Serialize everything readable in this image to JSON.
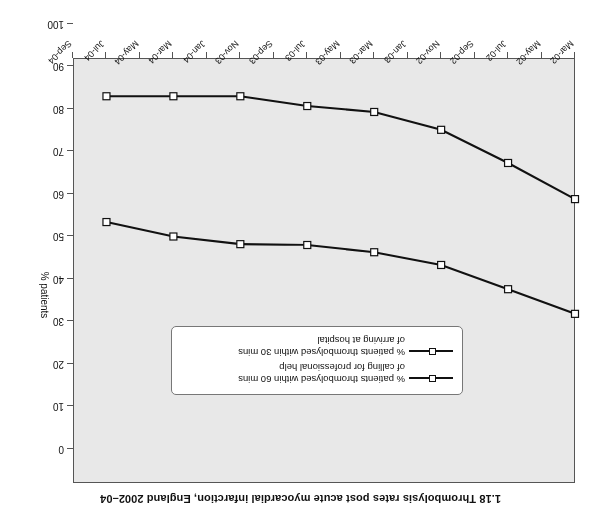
{
  "figure": {
    "title": "1.18 Thrombolysis rates post acute myocardial infarction, England 2002–04",
    "orientation_note": "rotated-180"
  },
  "chart_data": {
    "type": "line",
    "title": "1.18 Thrombolysis rates post acute myocardial infarction, England 2002–04",
    "xlabel": "",
    "ylabel": "% patients",
    "ylim": [
      0,
      100
    ],
    "ytick_labels": [
      "0",
      "10",
      "20",
      "30",
      "40",
      "50",
      "60",
      "70",
      "80",
      "90",
      "100"
    ],
    "yticks": [
      0,
      10,
      20,
      30,
      40,
      50,
      60,
      70,
      80,
      90,
      100
    ],
    "grid": false,
    "legend_position": "upper-centre",
    "categories": [
      "Mar-02",
      "May-02",
      "Jul-02",
      "Sep-02",
      "Nov-02",
      "Jan-03",
      "Mar-03",
      "May-03",
      "Jul-03",
      "Sep-03",
      "Nov-03",
      "Jan-04",
      "Mar-04",
      "May-04",
      "Jul-04",
      "Sep-04"
    ],
    "marked_categories": [
      "Mar-02",
      "Jul-02",
      "Nov-02",
      "Mar-03",
      "Jul-03",
      "Nov-03",
      "Mar-04",
      "Jul-04"
    ],
    "series": [
      {
        "name": "% patients thrombolysed within 30 mins of arriving at hospital",
        "name_lines": [
          "% patients thrombolysed within 30 mins",
          "of arriving at hospital"
        ],
        "x": [
          "Mar-02",
          "Jul-02",
          "Nov-02",
          "Mar-03",
          "Jul-03",
          "Nov-03",
          "Mar-04",
          "Jul-04"
        ],
        "values": [
          58.8,
          67.3,
          75.1,
          79.3,
          80.7,
          83.0,
          83.0,
          83.0
        ],
        "color": "#111111",
        "marker": "white-square"
      },
      {
        "name": "% patients thrombolysed within 60 mins of calling for professional help",
        "name_lines": [
          "% patients thrombolysed within 60 mins",
          "of calling for professional help"
        ],
        "x": [
          "Mar-02",
          "Jul-02",
          "Nov-02",
          "Mar-03",
          "Jul-03",
          "Nov-03",
          "Mar-04",
          "Jul-04"
        ],
        "values": [
          31.8,
          37.6,
          43.3,
          46.3,
          48.0,
          48.2,
          50.0,
          53.4
        ],
        "color": "#111111",
        "marker": "white-square"
      }
    ]
  },
  "colors": {
    "plot_background": "#e8e8e8",
    "axis": "#555555",
    "line": "#111111",
    "marker_fill": "#ffffff",
    "page_background": "#ffffff"
  }
}
